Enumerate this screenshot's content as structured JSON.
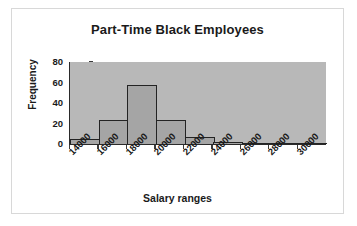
{
  "chart_data": {
    "type": "bar",
    "title": "Part-Time Black Employees",
    "xlabel": "Salary ranges",
    "ylabel": "Frequency",
    "categories": [
      "14000",
      "16000",
      "18000",
      "20000",
      "22000",
      "24000",
      "26000",
      "28000",
      "30000"
    ],
    "values": [
      5,
      23,
      58,
      23,
      7,
      2,
      1,
      0,
      1
    ],
    "ylim": [
      0,
      80
    ],
    "yticks": [
      0,
      20,
      40,
      60,
      80
    ],
    "grid": false,
    "legend": false,
    "plot_background_color": "#b8b8b8",
    "bar_fill_color": "#a5a5a5",
    "bar_border_color": "#232323",
    "axis_color": "#2a2a2a",
    "text_color": "#1a1a1a",
    "frame_border_color": "#d8d8d8"
  }
}
